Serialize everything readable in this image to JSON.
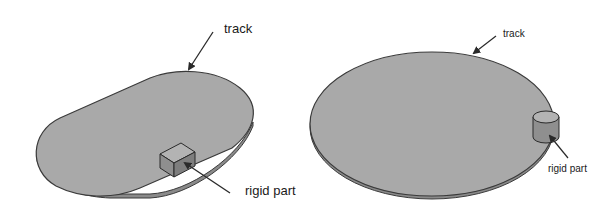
{
  "figure": {
    "left_panel": {
      "shape": "stadium-track",
      "track_label": "track",
      "part_label": "rigid part",
      "part_shape": "cube"
    },
    "right_panel": {
      "shape": "elliptical-disc-track",
      "track_label": "track",
      "part_label": "rigid part",
      "part_shape": "cylinder"
    },
    "colors": {
      "track_fill": "#a9a9a9",
      "track_edge": "#3a3a3a",
      "part_top": "#b3b3b3",
      "part_front": "#8f8f8f",
      "part_side": "#7e7e7e",
      "arrow": "#2a2a2a",
      "background": "#ffffff"
    }
  }
}
